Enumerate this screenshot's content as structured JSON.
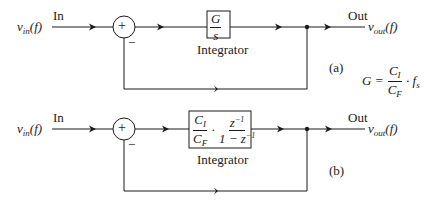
{
  "diagram_a": {
    "input_signal": "v",
    "input_sub": "in",
    "input_arg": "(f)",
    "in_label": "In",
    "summer_sign": "+",
    "minus_sign": "−",
    "block_num": "G",
    "block_den": "s",
    "block_caption": "Integrator",
    "out_label": "Out",
    "output_signal": "v",
    "output_sub": "out",
    "output_arg": "(f)",
    "tag": "(a)",
    "eq_lhs": "G = ",
    "eq_num": "C",
    "eq_num_sub": "I",
    "eq_den": "C",
    "eq_den_sub": "F",
    "eq_rhs": "· f",
    "eq_rhs_sub": "s"
  },
  "diagram_b": {
    "input_signal": "v",
    "input_sub": "in",
    "input_arg": "(f)",
    "in_label": "In",
    "summer_sign": "+",
    "minus_sign": "−",
    "block_num1": "C",
    "block_num1_sub": "I",
    "block_den1": "C",
    "block_den1_sub": "F",
    "block_dot": "·",
    "block_num2": "z",
    "block_num2_sup": "−1",
    "block_den2": "1 − z",
    "block_den2_sup": "−1",
    "block_caption": "Integrator",
    "out_label": "Out",
    "output_signal": "v",
    "output_sub": "out",
    "output_arg": "(f)",
    "tag": "(b)"
  }
}
